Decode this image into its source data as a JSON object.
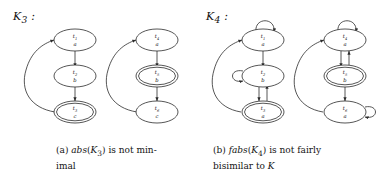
{
  "figure": {
    "panel_a": {
      "system_label": "K3 :",
      "system_label_base": "K",
      "system_label_sub": "3",
      "caption_line1_pre": "(a) ",
      "caption_italic": "abs",
      "caption_arg_open": "(",
      "caption_arg": "K",
      "caption_arg_sub": "3",
      "caption_arg_close": ")",
      "caption_rest": " is not min-",
      "caption_line2": "imal",
      "graphs": [
        {
          "name": "left-automaton",
          "nodes": [
            {
              "id": "t1",
              "state": "t",
              "sub": "1",
              "label": "a",
              "accepting": false,
              "self_loop": "none"
            },
            {
              "id": "t2",
              "state": "t",
              "sub": "2",
              "label": "b",
              "accepting": false,
              "self_loop": "none"
            },
            {
              "id": "t3",
              "state": "t",
              "sub": "3",
              "label": "c",
              "accepting": true,
              "self_loop": "none"
            }
          ],
          "edges": [
            {
              "from": "t1",
              "to": "t2",
              "kind": "straight"
            },
            {
              "from": "t2",
              "to": "t3",
              "kind": "straight"
            },
            {
              "from": "t3",
              "to": "t1",
              "kind": "curved-left-feedback"
            }
          ]
        },
        {
          "name": "right-automaton",
          "nodes": [
            {
              "id": "t4",
              "state": "t",
              "sub": "4",
              "label": "a",
              "accepting": false,
              "self_loop": "none"
            },
            {
              "id": "t5",
              "state": "t",
              "sub": "5",
              "label": "b",
              "accepting": true,
              "self_loop": "none"
            },
            {
              "id": "t6",
              "state": "t",
              "sub": "6",
              "label": "c",
              "accepting": false,
              "self_loop": "none"
            }
          ],
          "edges": [
            {
              "from": "t4",
              "to": "t5",
              "kind": "straight"
            },
            {
              "from": "t5",
              "to": "t6",
              "kind": "straight"
            },
            {
              "from": "t6",
              "to": "t4",
              "kind": "curved-left-feedback"
            }
          ]
        }
      ]
    },
    "panel_b": {
      "system_label": "K4 :",
      "system_label_base": "K",
      "system_label_sub": "4",
      "caption_line1_pre": "(b) ",
      "caption_italic": "fabs",
      "caption_arg_open": "(",
      "caption_arg": "K",
      "caption_arg_sub": "4",
      "caption_arg_close": ")",
      "caption_rest": " is not fairly",
      "caption_line2_pre": "bisimilar to ",
      "caption_line2_sym": "K",
      "graphs": [
        {
          "name": "left-automaton",
          "nodes": [
            {
              "id": "t1",
              "state": "t",
              "sub": "1",
              "label": "a",
              "accepting": false,
              "self_loop": "top"
            },
            {
              "id": "t2",
              "state": "t",
              "sub": "2",
              "label": "b",
              "accepting": false,
              "self_loop": "left"
            },
            {
              "id": "t3",
              "state": "t",
              "sub": "3",
              "label": "a",
              "accepting": true,
              "self_loop": "none"
            }
          ],
          "edges": [
            {
              "from": "t1",
              "to": "t2",
              "kind": "straight"
            },
            {
              "from": "t2",
              "to": "t3",
              "kind": "double-vertical"
            },
            {
              "from": "t3",
              "to": "t1",
              "kind": "curved-left-feedback"
            }
          ]
        },
        {
          "name": "right-automaton",
          "nodes": [
            {
              "id": "t4",
              "state": "t",
              "sub": "4",
              "label": "a",
              "accepting": false,
              "self_loop": "top"
            },
            {
              "id": "t5",
              "state": "t",
              "sub": "5",
              "label": "b",
              "accepting": true,
              "self_loop": "none"
            },
            {
              "id": "t6",
              "state": "t",
              "sub": "6",
              "label": "a",
              "accepting": false,
              "self_loop": "right"
            }
          ],
          "edges": [
            {
              "from": "t4",
              "to": "t5",
              "kind": "double-vertical"
            },
            {
              "from": "t5",
              "to": "t6",
              "kind": "straight"
            },
            {
              "from": "t6",
              "to": "t4",
              "kind": "curved-left-feedback"
            }
          ]
        }
      ]
    }
  },
  "colors": {
    "stroke": "#2b2b2b",
    "text": "#141414",
    "background": "#ffffff"
  }
}
